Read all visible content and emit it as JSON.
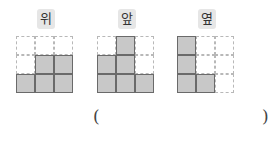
{
  "views": [
    {
      "label": "위",
      "name": "top",
      "cells": [
        [
          0,
          0,
          0
        ],
        [
          0,
          1,
          1
        ],
        [
          1,
          1,
          1
        ]
      ]
    },
    {
      "label": "앞",
      "name": "front",
      "cells": [
        [
          0,
          1,
          0
        ],
        [
          1,
          1,
          0
        ],
        [
          1,
          1,
          1
        ]
      ]
    },
    {
      "label": "옆",
      "name": "side",
      "cells": [
        [
          1,
          0,
          0
        ],
        [
          1,
          0,
          0
        ],
        [
          1,
          1,
          0
        ]
      ]
    }
  ],
  "answer": {
    "open": "(",
    "close": ")",
    "value": ""
  }
}
